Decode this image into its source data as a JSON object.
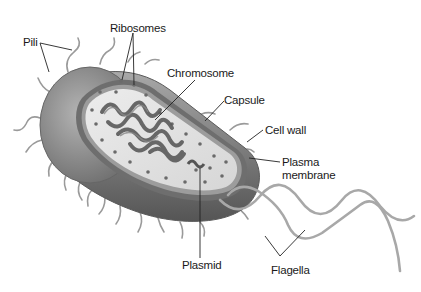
{
  "diagram": {
    "colors": {
      "background": "#ffffff",
      "capsule": "#8a8a8a",
      "cell_wall": "#6e6e6e",
      "cytoplasm": "#e4e4e4",
      "chromosome": "#5a5a5a",
      "ribosome": "#6a6a6a",
      "appendage": "#9a9a9a",
      "leader_line": "#222222",
      "label_text": "#1a1a1a"
    },
    "labels": {
      "pili": "Pili",
      "ribosomes": "Ribosomes",
      "chromosome": "Chromosome",
      "capsule": "Capsule",
      "cell_wall": "Cell wall",
      "plasma_membrane_line1": "Plasma",
      "plasma_membrane_line2": "membrane",
      "plasmid": "Plasmid",
      "flagella": "Flagella"
    }
  }
}
